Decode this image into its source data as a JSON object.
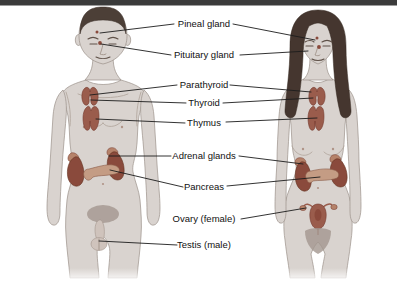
{
  "page": {
    "top_bar_color": "#3b3b3b",
    "background": "#ffffff"
  },
  "diagram": {
    "figures": [
      {
        "name": "male",
        "side": "left"
      },
      {
        "name": "female",
        "side": "right"
      }
    ],
    "labels": {
      "pineal": "Pineal gland",
      "pituitary": "Pituitary gland",
      "parathyroid": "Parathyroid",
      "thyroid": "Thyroid",
      "thymus": "Thymus",
      "adrenal": "Adrenal glands",
      "pancreas": "Pancreas",
      "ovary": "Ovary (female)",
      "testis": "Testis (male)"
    },
    "colors": {
      "organ_red": "#9a5c4c",
      "kidney": "#8a4a3c",
      "adrenal": "#b5826a",
      "pancreas": "#c49c84",
      "skin": "#d9d3cf",
      "hair_male": "#4c3f37",
      "hair_female": "#45362f",
      "leader_line": "#1c1c1c"
    }
  }
}
